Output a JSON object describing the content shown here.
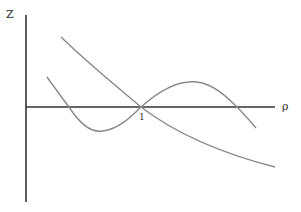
{
  "diagram": {
    "y_axis_label": "Z",
    "x_axis_label": "ρ",
    "intersection_label": "1",
    "colors": {
      "axes": "#333333",
      "curves": "#8a8a8a"
    },
    "curves": [
      {
        "name": "decreasing-curve",
        "description": "monotonically decreasing curve crossing the ρ-axis at 1"
      },
      {
        "name": "oscillating-curve",
        "description": "wave curve crossing the ρ-axis three times, including at 1"
      }
    ]
  }
}
